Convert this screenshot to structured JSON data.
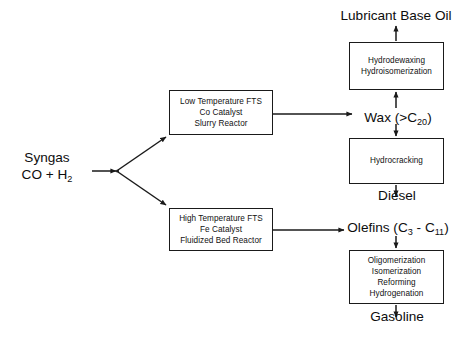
{
  "diagram": {
    "background_color": "#ffffff",
    "line_color": "#1a1a1a",
    "text_color": "#0d0d0d",
    "width": 462,
    "height": 343
  },
  "feed": {
    "name_line1": "Syngas",
    "name_line2_pre": "CO + H",
    "name_line2_sub": "2"
  },
  "reactors": {
    "low_temperature": {
      "line1": "Low Temperature FTS",
      "line2": "Co Catalyst",
      "line3": "Slurry Reactor"
    },
    "high_temperature": {
      "line1": "High Temperature FTS",
      "line2": "Fe Catalyst",
      "line3": "Fluidized Bed Reactor"
    }
  },
  "upgrading_units": {
    "hydrodewaxing": {
      "line1": "Hydrodewaxing",
      "line2": "Hydroisomerization"
    },
    "hydrocracking": {
      "line1": "Hydrocracking"
    },
    "gasoline_upgrading": {
      "line1": "Oligomerization",
      "line2": "Isomerization",
      "line3": "Reforming",
      "line4": "Hydrogenation"
    }
  },
  "streams": {
    "wax": {
      "pre": "Wax (>C",
      "sub": "20",
      "post": ")"
    },
    "olefins": {
      "pre": "Olefins (C",
      "sub1": "3",
      "mid": " - C",
      "sub2": "11",
      "post": ")"
    }
  },
  "products": {
    "lubricant_base_oil": "Lubricant Base Oil",
    "diesel": "Diesel",
    "gasoline": "Gasoline"
  }
}
